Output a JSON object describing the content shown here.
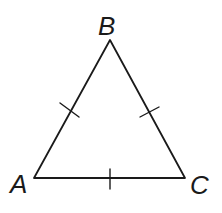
{
  "diagram": {
    "type": "equilateral-triangle",
    "vertices": [
      {
        "label": "A",
        "x": 34,
        "y": 178
      },
      {
        "label": "B",
        "x": 110,
        "y": 40
      },
      {
        "label": "C",
        "x": 185,
        "y": 178
      }
    ],
    "labels": {
      "A": "A",
      "B": "B",
      "C": "C"
    },
    "congruence_ticks": {
      "AB": 1,
      "BC": 1,
      "AC": 1
    },
    "stroke_color": "#1a1a1a",
    "background": "#ffffff"
  }
}
